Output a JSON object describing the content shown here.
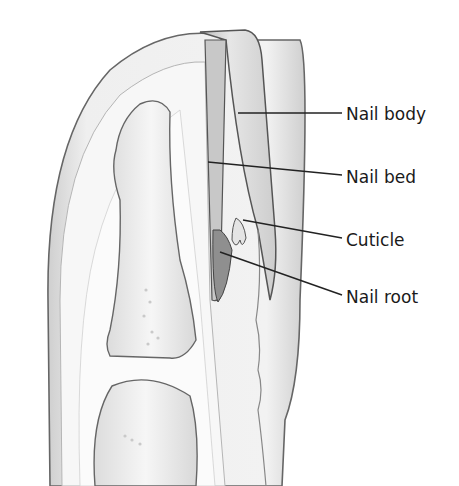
{
  "diagram": {
    "labels": [
      {
        "id": "nail-body",
        "text": "Nail body",
        "x": 346,
        "y": 104,
        "line": [
          238,
          113,
          342,
          113
        ]
      },
      {
        "id": "nail-bed",
        "text": "Nail bed",
        "x": 346,
        "y": 167,
        "line": [
          208,
          162,
          342,
          175
        ]
      },
      {
        "id": "cuticle",
        "text": "Cuticle",
        "x": 346,
        "y": 230,
        "line": [
          243,
          220,
          342,
          238
        ]
      },
      {
        "id": "nail-root",
        "text": "Nail root",
        "x": 346,
        "y": 287,
        "line": [
          220,
          252,
          342,
          295
        ]
      }
    ],
    "colors": {
      "outline": "#555555",
      "shade": "#d8d8d8",
      "light": "#f2f2f2",
      "text": "#1a1a1a",
      "leader": "#222222"
    }
  }
}
